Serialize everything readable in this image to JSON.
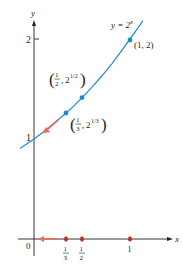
{
  "figure": {
    "type": "function-graph",
    "function_label": "y = 2",
    "function_exponent": "x",
    "axes": {
      "x_label": "x",
      "y_label": "y",
      "origin_label": "0",
      "y_ticks": [
        {
          "value": 1,
          "label": "1"
        },
        {
          "value": 2,
          "label": "2"
        }
      ],
      "x_ticks": [
        {
          "value": 0.3333,
          "num": "1",
          "den": "3"
        },
        {
          "value": 0.5,
          "num": "1",
          "den": "2"
        },
        {
          "value": 1,
          "label": "1"
        }
      ]
    },
    "points": [
      {
        "id": "p1",
        "x": 1,
        "y": 2,
        "label": "(1, 2)"
      },
      {
        "id": "p2",
        "x": 0.5,
        "y": 1.4142,
        "label_num": "1",
        "label_den": "2",
        "label_base": "2",
        "label_exp": "1/2"
      },
      {
        "id": "p3",
        "x": 0.3333,
        "y": 1.2599,
        "label_num": "1",
        "label_den": "3",
        "label_base": "2",
        "label_exp": "1/3"
      }
    ],
    "colors": {
      "curve": "#2a8fcf",
      "point": "#1c8ac4",
      "arrow": "#e8705a",
      "x_marker": "#b8352a",
      "axis": "#231f20",
      "text": "#231f20"
    }
  }
}
